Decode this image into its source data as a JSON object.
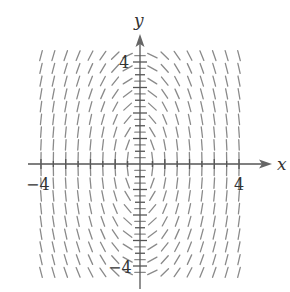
{
  "chart_data": {
    "type": "slope_field",
    "title": "",
    "xlabel": "x",
    "ylabel": "y",
    "equation_estimate": "dy/dx = -4x/y",
    "xlim": [
      -4,
      4
    ],
    "ylim": [
      -4,
      4
    ],
    "x_tick_labels": [
      {
        "value": -4,
        "label": "−4"
      },
      {
        "value": 4,
        "label": "4"
      }
    ],
    "y_tick_labels": [
      {
        "value": 4,
        "label": "4"
      },
      {
        "value": -4,
        "label": "−4"
      }
    ],
    "x_ticks": [
      -4,
      -3.5,
      -3,
      -2.5,
      -2,
      -1.5,
      -1,
      -0.5,
      0.5,
      1,
      1.5,
      2,
      2.5,
      3,
      3.5,
      4
    ],
    "y_ticks": [
      -4,
      -3.5,
      -3,
      -2.5,
      -2,
      -1.5,
      -1,
      -0.5,
      0.5,
      1,
      1.5,
      2,
      2.5,
      3,
      3.5,
      4
    ],
    "field_grid": {
      "x_start": -4,
      "x_end": 4,
      "x_step": 0.5,
      "y_start": -4.25,
      "y_end": 4.25,
      "y_step": 0.5
    },
    "grid": false,
    "legend": null
  },
  "colors": {
    "axis": "#555555",
    "segments": "#8a8a8a",
    "text": "#333333"
  },
  "labels": {
    "x_axis": "x",
    "y_axis": "y",
    "x_min": "−4",
    "x_max": "4",
    "y_max": "4",
    "y_min": "−4"
  }
}
